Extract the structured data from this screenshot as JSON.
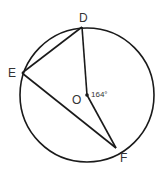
{
  "diagram": {
    "type": "circle-geometry",
    "circle": {
      "center_label": "O",
      "cx": 87,
      "cy": 95,
      "r": 67
    },
    "points": {
      "D": {
        "label": "D",
        "x": 82,
        "y": 27
      },
      "E": {
        "label": "E",
        "x": 22,
        "y": 73
      },
      "F": {
        "label": "F",
        "x": 116,
        "y": 148
      },
      "O": {
        "label": "O",
        "x": 87,
        "y": 95
      }
    },
    "segments": [
      "DE",
      "EF",
      "OD",
      "OF"
    ],
    "angle_label": "164°",
    "colors": {
      "stroke": "#1a1a1a",
      "text": "#333333"
    }
  }
}
